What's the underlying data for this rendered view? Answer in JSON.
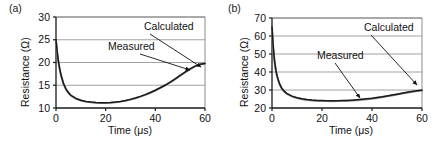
{
  "figure": {
    "panels": [
      {
        "label": "(a)",
        "xlabel": "Time (μs)",
        "ylabel": "Resistance (Ω)",
        "annotations": [
          {
            "text": "Calculated"
          },
          {
            "text": "Measured"
          }
        ]
      },
      {
        "label": "(b)",
        "xlabel": "Time (μs)",
        "ylabel": "Resistance (Ω)",
        "annotations": [
          {
            "text": "Calculated"
          },
          {
            "text": "Measured"
          }
        ]
      }
    ]
  },
  "chart_data": [
    {
      "type": "line",
      "title": "(a)",
      "xlabel": "Time (μs)",
      "ylabel": "Resistance (Ω)",
      "xlim": [
        0,
        60
      ],
      "ylim": [
        10,
        30
      ],
      "xticks": [
        0,
        20,
        40,
        60
      ],
      "yticks": [
        10,
        15,
        20,
        25,
        30
      ],
      "grid": "horizontal",
      "legend": "annotations",
      "series": [
        {
          "name": "Calculated",
          "color": "#1a1a1a",
          "x": [
            0,
            0.5,
            1,
            1.5,
            2,
            3,
            4,
            5,
            6,
            8,
            10,
            12,
            14,
            16,
            18,
            20,
            22,
            24,
            26,
            28,
            30,
            32,
            34,
            36,
            38,
            40,
            42,
            44,
            46,
            48,
            50,
            52,
            54,
            56,
            58,
            60
          ],
          "y": [
            25.0,
            22.3,
            20.2,
            18.6,
            17.3,
            15.4,
            14.2,
            13.4,
            12.8,
            12.1,
            11.7,
            11.45,
            11.3,
            11.2,
            11.15,
            11.15,
            11.2,
            11.3,
            11.45,
            11.65,
            11.9,
            12.2,
            12.55,
            12.95,
            13.4,
            13.9,
            14.45,
            15.05,
            15.7,
            16.4,
            17.15,
            17.9,
            18.6,
            19.2,
            19.6,
            19.8
          ]
        },
        {
          "name": "Measured",
          "color": "#8c8c8c",
          "x": [
            0,
            0.5,
            1,
            1.5,
            2,
            3,
            4,
            5,
            6,
            8,
            10,
            12,
            14,
            16,
            18,
            20,
            22,
            24,
            26,
            28,
            30,
            32,
            34,
            36,
            38,
            40,
            42,
            44,
            46,
            48,
            50,
            52,
            54,
            56,
            58,
            60
          ],
          "y": [
            24.8,
            22.1,
            20.0,
            18.5,
            17.2,
            15.3,
            14.1,
            13.3,
            12.75,
            12.05,
            11.65,
            11.4,
            11.25,
            11.15,
            11.1,
            11.1,
            11.15,
            11.25,
            11.4,
            11.6,
            11.85,
            12.15,
            12.5,
            12.9,
            13.35,
            13.85,
            14.4,
            15.0,
            15.65,
            16.35,
            17.1,
            17.85,
            18.55,
            19.15,
            19.55,
            19.75
          ]
        }
      ]
    },
    {
      "type": "line",
      "title": "(b)",
      "xlabel": "Time (μs)",
      "ylabel": "Resistance (Ω)",
      "xlim": [
        0,
        60
      ],
      "ylim": [
        20,
        70
      ],
      "xticks": [
        0,
        20,
        40,
        60
      ],
      "yticks": [
        20,
        30,
        40,
        50,
        60,
        70
      ],
      "grid": "horizontal",
      "legend": "annotations",
      "series": [
        {
          "name": "Calculated",
          "color": "#1a1a1a",
          "x": [
            0,
            0.5,
            1,
            1.5,
            2,
            3,
            4,
            5,
            6,
            8,
            10,
            12,
            14,
            16,
            18,
            20,
            22,
            24,
            26,
            28,
            30,
            32,
            34,
            36,
            38,
            40,
            42,
            44,
            46,
            48,
            50,
            52,
            54,
            56,
            58,
            60
          ],
          "y": [
            65.0,
            54.0,
            46.5,
            41.5,
            38.0,
            33.5,
            30.8,
            29.2,
            28.0,
            26.6,
            25.7,
            25.1,
            24.7,
            24.4,
            24.2,
            24.1,
            24.05,
            24.0,
            24.05,
            24.1,
            24.2,
            24.35,
            24.55,
            24.8,
            25.1,
            25.4,
            25.8,
            26.2,
            26.7,
            27.2,
            27.7,
            28.2,
            28.7,
            29.2,
            29.6,
            29.9
          ]
        },
        {
          "name": "Measured",
          "color": "#8c8c8c",
          "x": [
            0,
            0.5,
            1,
            1.5,
            2,
            3,
            4,
            5,
            6,
            8,
            10,
            12,
            14,
            16,
            18,
            20,
            22,
            24,
            26,
            28,
            30,
            32,
            34,
            36,
            38,
            40,
            42,
            44,
            46,
            48,
            50,
            52,
            54,
            56,
            58,
            60
          ],
          "y": [
            64.0,
            53.2,
            46.0,
            41.0,
            37.6,
            33.2,
            30.5,
            28.9,
            27.8,
            26.4,
            25.5,
            24.9,
            24.5,
            24.2,
            24.0,
            23.9,
            23.85,
            23.8,
            23.85,
            23.9,
            24.0,
            24.15,
            24.35,
            24.6,
            24.9,
            25.2,
            25.6,
            26.0,
            26.5,
            27.0,
            27.5,
            28.0,
            28.5,
            29.0,
            29.45,
            29.8
          ]
        }
      ]
    }
  ]
}
